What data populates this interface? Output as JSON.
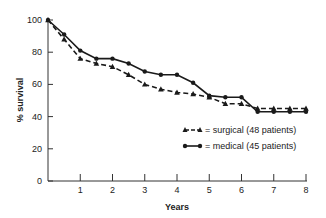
{
  "chart_data": {
    "type": "line",
    "title": "",
    "xlabel": "Years",
    "ylabel": "% survival",
    "xlim": [
      0,
      8
    ],
    "ylim": [
      0,
      100
    ],
    "xticks": [
      1,
      2,
      3,
      4,
      5,
      6,
      7,
      8
    ],
    "yticks": [
      0,
      20,
      40,
      60,
      80,
      100
    ],
    "grid": false,
    "legend_position": "center-right",
    "x": [
      0,
      0.5,
      1,
      1.5,
      2,
      2.5,
      3,
      3.5,
      4,
      4.5,
      5,
      5.5,
      6,
      6.5,
      7,
      7.5,
      8
    ],
    "series": [
      {
        "name": "surgical (48 patients)",
        "marker": "triangle",
        "line_style": "dashed",
        "values": [
          100,
          88,
          76,
          73,
          71,
          66,
          60,
          57,
          55,
          54,
          52,
          48,
          48,
          45,
          45,
          45,
          45
        ]
      },
      {
        "name": "medical (45 patients)",
        "marker": "circle",
        "line_style": "solid",
        "values": [
          100,
          91,
          81,
          76,
          76,
          73,
          68,
          66,
          66,
          61,
          53,
          52,
          52,
          43,
          43,
          43,
          43
        ]
      }
    ],
    "legend": [
      {
        "label": "= surgical (48 patients)"
      },
      {
        "label": "= medical (45 patients)"
      }
    ],
    "colors": {
      "line": "#1a1a1a",
      "axis": "#333333",
      "text": "#222222"
    }
  },
  "labels": {
    "xlabel": "Years",
    "ylabel": "% survival",
    "legend_surgical": "= surgical (48 patients)",
    "legend_medical": "= medical (45 patients)"
  }
}
